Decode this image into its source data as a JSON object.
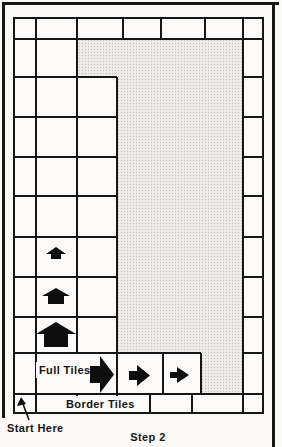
{
  "labels": {
    "full_tiles": "Full Tiles",
    "border_tiles": "Border Tiles",
    "start_here": "Start Here",
    "caption": "Step 2"
  },
  "colors": {
    "paper": "#faf9f6",
    "line": "#161616",
    "arrow": "#0e0e0e",
    "shading_bg": "#edebe7",
    "shading_dot": "#c5c4c1"
  },
  "grid": {
    "h_lines": [
      [
        13,
        39,
        264
      ],
      [
        13,
        77,
        117
      ],
      [
        243,
        77,
        264
      ],
      [
        13,
        117,
        117
      ],
      [
        243,
        117,
        264
      ],
      [
        13,
        157,
        117
      ],
      [
        243,
        157,
        264
      ],
      [
        13,
        196,
        117
      ],
      [
        243,
        196,
        264
      ],
      [
        13,
        237,
        117
      ],
      [
        243,
        237,
        264
      ],
      [
        13,
        277,
        117
      ],
      [
        243,
        277,
        264
      ],
      [
        13,
        317,
        117
      ],
      [
        243,
        317,
        264
      ],
      [
        13,
        353,
        201
      ],
      [
        243,
        353,
        264
      ],
      [
        13,
        394,
        264
      ]
    ],
    "v_lines": [
      [
        36,
        17,
        414
      ],
      [
        77,
        17,
        353
      ],
      [
        77,
        394,
        414
      ],
      [
        117,
        77,
        414
      ],
      [
        123,
        17,
        39
      ],
      [
        161,
        17,
        39
      ],
      [
        205,
        17,
        39
      ],
      [
        163,
        353,
        394
      ],
      [
        201,
        353,
        394
      ],
      [
        150,
        394,
        414
      ],
      [
        192,
        394,
        414
      ],
      [
        243,
        17,
        414
      ]
    ]
  },
  "shaded_region": {
    "points": [
      [
        78,
        40
      ],
      [
        243,
        40
      ],
      [
        243,
        394
      ],
      [
        202,
        394
      ],
      [
        202,
        354
      ],
      [
        118,
        354
      ],
      [
        118,
        78
      ],
      [
        78,
        78
      ]
    ]
  },
  "arrows": {
    "up_small": {
      "direction": "up",
      "points": "51,259 51,254 46,254 56,247 66,254 61,254 61,259"
    },
    "up_medium": {
      "direction": "up",
      "points": "48,304 48,296 42,296 56,288 70,296 64,296 64,304"
    },
    "up_large": {
      "direction": "up",
      "points": "44,347 44,334 36,334 56,322 76,334 68,334 68,347"
    },
    "right_large": {
      "direction": "right",
      "points": "90,366 100,366 100,356 114,374.5 100,393 100,383 90,383"
    },
    "right_medium": {
      "direction": "right",
      "points": "129,371 137,371 137,365 150,375.5 137,386 137,380 129,380"
    },
    "right_small": {
      "direction": "right",
      "points": "170,372 177,372 177,367 189,375 177,383 177,378 170,378"
    },
    "start_here_pointer": {
      "line": {
        "x1": 29,
        "y1": 420,
        "x2": 23,
        "y2": 404
      },
      "head_points": "21,397 17,406 26,404"
    }
  }
}
